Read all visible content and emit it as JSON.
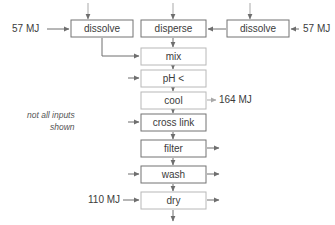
{
  "diagram": {
    "note": {
      "line1": "not all inputs",
      "line2": "shown"
    },
    "colors": {
      "box_border_solid": "#737373",
      "box_border_light": "#b8b8b8",
      "connector": "#6e6e6e",
      "connector_light": "#a9a9a9",
      "text": "#3b3b3b",
      "background": "#ffffff"
    },
    "nodes": [
      {
        "id": "dissolve_left",
        "label": "dissolve",
        "x": 71,
        "y": 20,
        "w": 62,
        "h": 17,
        "border": "solid"
      },
      {
        "id": "dissolve_right",
        "label": "dissolve",
        "x": 227,
        "y": 20,
        "w": 62,
        "h": 17,
        "border": "solid"
      },
      {
        "id": "disperse",
        "label": "disperse",
        "x": 141,
        "y": 20,
        "w": 65,
        "h": 17,
        "border": "solid"
      },
      {
        "id": "mix",
        "label": "mix",
        "x": 141,
        "y": 48,
        "w": 65,
        "h": 17,
        "border": "light"
      },
      {
        "id": "ph",
        "label": "pH <",
        "x": 141,
        "y": 70,
        "w": 65,
        "h": 17,
        "border": "light"
      },
      {
        "id": "cool",
        "label": "cool",
        "x": 141,
        "y": 92,
        "w": 65,
        "h": 17,
        "border": "light"
      },
      {
        "id": "cross_link",
        "label": "cross link",
        "x": 141,
        "y": 114,
        "w": 65,
        "h": 17,
        "border": "solid"
      },
      {
        "id": "filter",
        "label": "filter",
        "x": 141,
        "y": 140,
        "w": 65,
        "h": 17,
        "border": "solid"
      },
      {
        "id": "wash",
        "label": "wash",
        "x": 141,
        "y": 166,
        "w": 65,
        "h": 17,
        "border": "solid"
      },
      {
        "id": "dry",
        "label": "dry",
        "x": 141,
        "y": 192,
        "w": 65,
        "h": 17,
        "border": "light"
      }
    ],
    "energy_labels": [
      {
        "id": "energy_dissolve_left",
        "text": "57 MJ",
        "x": 12,
        "y": 29,
        "anchor": "start"
      },
      {
        "id": "energy_dissolve_right",
        "text": "57 MJ",
        "x": 302,
        "y": 29,
        "anchor": "start"
      },
      {
        "id": "energy_cool",
        "text": "164 MJ",
        "x": 218,
        "y": 100,
        "anchor": "start"
      },
      {
        "id": "energy_dry",
        "text": "110 MJ",
        "x": 88,
        "y": 200,
        "anchor": "start"
      }
    ]
  }
}
